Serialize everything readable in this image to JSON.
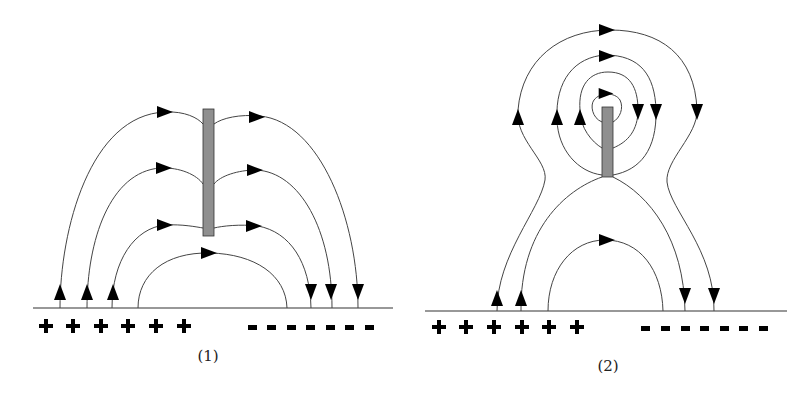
{
  "figure": {
    "panels": [
      {
        "id": 1,
        "label": "(1)",
        "description": "Electric field lines from positive charges to negative charges around a vertical conducting rod placed far above the plate",
        "positive_charges": [
          "+",
          "+",
          "+",
          "+",
          "+",
          "+"
        ],
        "negative_charges": [
          "-",
          "-",
          "-",
          "-",
          "-",
          "-",
          "-"
        ]
      },
      {
        "id": 2,
        "label": "(2)",
        "description": "Electric field lines showing closed loops around a short vertical rod, with field lines bulging around it",
        "positive_charges": [
          "+",
          "+",
          "+",
          "+",
          "+",
          "+"
        ],
        "negative_charges": [
          "-",
          "-",
          "-",
          "-",
          "-",
          "-",
          "-"
        ]
      }
    ],
    "colors": {
      "rod_fill": "#8f8f8f",
      "line": "#444444",
      "arrow": "#000000"
    }
  }
}
